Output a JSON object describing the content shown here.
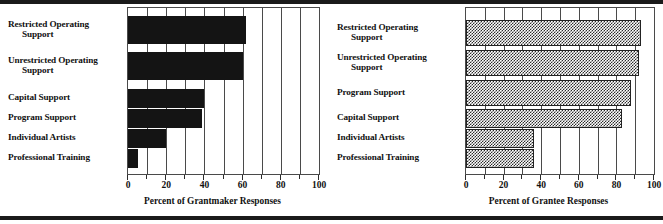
{
  "chart_data": [
    {
      "type": "bar",
      "orientation": "horizontal",
      "panel": "left",
      "title": "",
      "xlabel": "Percent of Grantmaker Responses",
      "ylabel": "",
      "xlim": [
        0,
        100
      ],
      "xticks": [
        0,
        20,
        40,
        60,
        80,
        100
      ],
      "xticklabels": [
        "0",
        "20",
        "40",
        "60",
        "80",
        "100"
      ],
      "minor_tick_step": 10,
      "grid": "vertical",
      "legend": "none",
      "bar_style": "solid-black",
      "bar_color": "#141414",
      "categories": [
        "Restricted Operating Support",
        "Unrestricted Operating Support",
        "Capital Support",
        "Program Support",
        "Individual Artists",
        "Professional Training"
      ],
      "category_lines": [
        [
          "Restricted Operating",
          "Support"
        ],
        [
          "Unrestricted Operating",
          "Support"
        ],
        [
          "Capital Support"
        ],
        [
          "Program Support"
        ],
        [
          "Individual Artists"
        ],
        [
          "Professional Training"
        ]
      ],
      "values": [
        62,
        60,
        40,
        39,
        20,
        5
      ]
    },
    {
      "type": "bar",
      "orientation": "horizontal",
      "panel": "right",
      "title": "",
      "xlabel": "Percent of Grantee Responses",
      "ylabel": "",
      "xlim": [
        0,
        100
      ],
      "xticks": [
        0,
        20,
        40,
        60,
        80,
        100
      ],
      "xticklabels": [
        "0",
        "20",
        "40",
        "60",
        "80",
        "100"
      ],
      "minor_tick_step": 10,
      "grid": "vertical",
      "legend": "none",
      "bar_style": "hatched-gray",
      "bar_color": "#2b2b2b",
      "categories": [
        "Restricted Operating Support",
        "Unrestricted Operating Support",
        "Program Support",
        "Capital Support",
        "Individual Artists",
        "Professional Training"
      ],
      "category_lines": [
        [
          "Restricted Operating",
          "Support"
        ],
        [
          "Unrestricted Operating",
          "Support"
        ],
        [
          "Program Support"
        ],
        [
          "Capital Support"
        ],
        [
          "Individual Artists"
        ],
        [
          "Professional Training"
        ]
      ],
      "values": [
        93,
        92,
        88,
        83,
        36,
        36
      ]
    }
  ]
}
